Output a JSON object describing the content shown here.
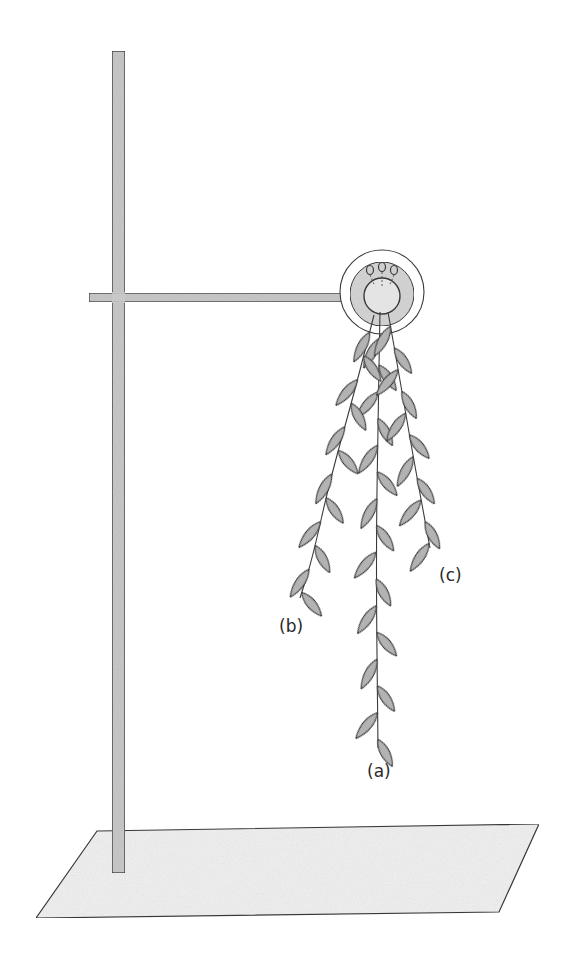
{
  "figure": {
    "labels": {
      "a": "(a)",
      "b": "(b)",
      "c": "(c)"
    },
    "label_positions": {
      "a": [
        367,
        763
      ],
      "b": [
        279,
        618
      ],
      "c": [
        439,
        567
      ]
    },
    "colors": {
      "outline": "#3a3a3a",
      "rod_fill": "#c9c9c9",
      "base_fill": "#f1f1f1",
      "leaf_fill": "#b8b8b8",
      "clamp_fill": "#d6d6d6"
    },
    "stand": {
      "pole": {
        "x": 112,
        "y": 51,
        "w": 13,
        "h": 822
      },
      "arm": {
        "x": 89,
        "y": 293,
        "w": 258,
        "h": 9
      },
      "base": [
        [
          97,
          831
        ],
        [
          539,
          824
        ],
        [
          499,
          912
        ],
        [
          36,
          918
        ]
      ]
    },
    "clamp": {
      "cx": 382,
      "cy": 292,
      "r_outer": 42,
      "r_mid": 32,
      "r_inner": 18
    },
    "shoots": [
      {
        "id": "a",
        "stem": [
          [
            380,
            312
          ],
          [
            378,
            420
          ],
          [
            376,
            560
          ],
          [
            378,
            748
          ]
        ]
      },
      {
        "id": "b",
        "stem": [
          [
            374,
            315
          ],
          [
            355,
            390
          ],
          [
            330,
            480
          ],
          [
            312,
            560
          ],
          [
            300,
            598
          ]
        ]
      },
      {
        "id": "c",
        "stem": [
          [
            388,
            312
          ],
          [
            400,
            380
          ],
          [
            412,
            450
          ],
          [
            430,
            548
          ]
        ]
      }
    ]
  }
}
